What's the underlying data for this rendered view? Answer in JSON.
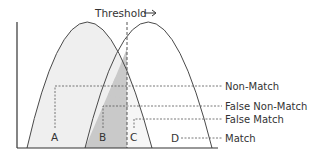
{
  "diagram": {
    "title": "Threshold",
    "title_arrow": "→",
    "colors": {
      "curve_stroke": "#4a4a4a",
      "axis_stroke": "#333333",
      "dash_stroke": "#555555",
      "region_a_fill": "#efefef",
      "region_b_fill": "#c9c9c9",
      "region_c_fill": "#f3f3f3",
      "text": "#333333"
    },
    "regions": [
      {
        "id": "A",
        "label": "A"
      },
      {
        "id": "B",
        "label": "B"
      },
      {
        "id": "C",
        "label": "C"
      },
      {
        "id": "D",
        "label": "D"
      }
    ],
    "legend": [
      {
        "label": "Non-Match",
        "region": "A"
      },
      {
        "label": "False Non-Match",
        "region": "B"
      },
      {
        "label": "False Match",
        "region": "C"
      },
      {
        "label": "Match",
        "region": "D"
      }
    ],
    "curves": [
      {
        "name": "non-match-distribution"
      },
      {
        "name": "match-distribution"
      }
    ]
  }
}
